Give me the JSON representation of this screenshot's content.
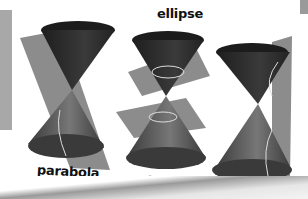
{
  "figure": {
    "labels": {
      "ellipse": "ellipse",
      "parabola": "parabola",
      "circle": "circle",
      "hyperbola": "hyperbola"
    },
    "colors": {
      "cone_dark": "#2a2a2a",
      "cone_mid": "#5a5a5a",
      "plane": "#8c8c8c",
      "curve": "#d8d8d8",
      "background": "#ffffff"
    }
  }
}
